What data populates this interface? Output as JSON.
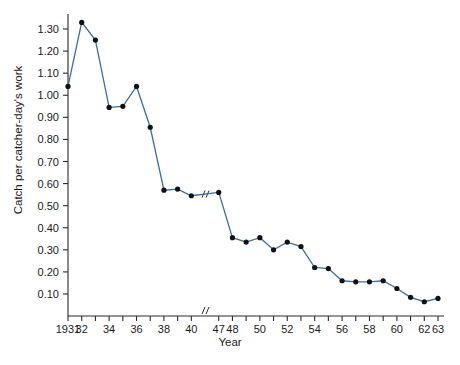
{
  "chart_data": {
    "type": "line",
    "title": "",
    "xlabel": "Year",
    "ylabel": "Catch per catcher-day's work",
    "ylim": [
      0.0,
      1.36
    ],
    "ytick_values": [
      0.1,
      0.2,
      0.3,
      0.4,
      0.5,
      0.6,
      0.7,
      0.8,
      0.9,
      1.0,
      1.1,
      1.2,
      1.3
    ],
    "ytick_labels": [
      "0.10",
      "0.20",
      "0.30",
      "0.40",
      "0.50",
      "0.60",
      "0.70",
      "0.80",
      "0.90",
      "1.00",
      "1.10",
      "1.20",
      "1.30"
    ],
    "xtick_labels": [
      "1931",
      "32",
      "34",
      "36",
      "38",
      "40",
      "47",
      "48",
      "50",
      "52",
      "54",
      "56",
      "58",
      "60",
      "62",
      "63"
    ],
    "xtick_label_years": [
      1931,
      1932,
      1934,
      1936,
      1938,
      1940,
      1947,
      1948,
      1950,
      1952,
      1954,
      1956,
      1958,
      1960,
      1962,
      1963
    ],
    "axis_break": {
      "present": true,
      "glyph": "//",
      "between": [
        1940,
        1947
      ]
    },
    "grid": false,
    "legend": null,
    "series": [
      {
        "name": "Catch per catcher-day's work",
        "color": "#3a6ea5",
        "marker_color": "#111111",
        "x": [
          1931,
          1932,
          1933,
          1934,
          1935,
          1936,
          1937,
          1938,
          1939,
          1940,
          1947,
          1948,
          1949,
          1950,
          1951,
          1952,
          1953,
          1954,
          1955,
          1956,
          1957,
          1958,
          1959,
          1960,
          1961,
          1962,
          1963
        ],
        "values": [
          1.04,
          1.33,
          1.25,
          0.945,
          0.95,
          1.04,
          0.855,
          0.57,
          0.575,
          0.545,
          0.56,
          0.355,
          0.335,
          0.355,
          0.3,
          0.335,
          0.315,
          0.22,
          0.215,
          0.16,
          0.155,
          0.155,
          0.16,
          0.125,
          0.085,
          0.065,
          0.08
        ]
      }
    ]
  }
}
